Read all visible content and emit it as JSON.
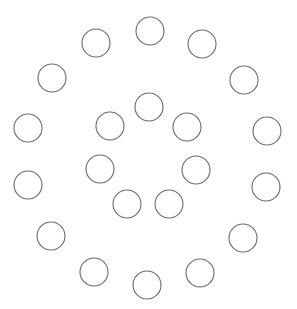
{
  "diagram": {
    "width": 297,
    "height": 309,
    "background": "#ffffff",
    "stroke_color": "#6a6a6a",
    "stroke_width": 1.1,
    "radius": 14,
    "circles": [
      {
        "ring": "outer",
        "cx": 150,
        "cy": 31
      },
      {
        "ring": "outer",
        "cx": 202,
        "cy": 44
      },
      {
        "ring": "outer",
        "cx": 244,
        "cy": 80
      },
      {
        "ring": "outer",
        "cx": 267,
        "cy": 131
      },
      {
        "ring": "outer",
        "cx": 266,
        "cy": 187
      },
      {
        "ring": "outer",
        "cx": 243,
        "cy": 238
      },
      {
        "ring": "outer",
        "cx": 200,
        "cy": 273
      },
      {
        "ring": "outer",
        "cx": 147,
        "cy": 285
      },
      {
        "ring": "outer",
        "cx": 94,
        "cy": 272
      },
      {
        "ring": "outer",
        "cx": 51,
        "cy": 236
      },
      {
        "ring": "outer",
        "cx": 28,
        "cy": 185
      },
      {
        "ring": "outer",
        "cx": 28,
        "cy": 128
      },
      {
        "ring": "outer",
        "cx": 52,
        "cy": 78
      },
      {
        "ring": "outer",
        "cx": 96,
        "cy": 43
      },
      {
        "ring": "inner",
        "cx": 149,
        "cy": 107
      },
      {
        "ring": "inner",
        "cx": 187,
        "cy": 127
      },
      {
        "ring": "inner",
        "cx": 196,
        "cy": 170
      },
      {
        "ring": "inner",
        "cx": 169,
        "cy": 204
      },
      {
        "ring": "inner",
        "cx": 127,
        "cy": 204
      },
      {
        "ring": "inner",
        "cx": 100,
        "cy": 169
      },
      {
        "ring": "inner",
        "cx": 110,
        "cy": 126
      }
    ]
  }
}
